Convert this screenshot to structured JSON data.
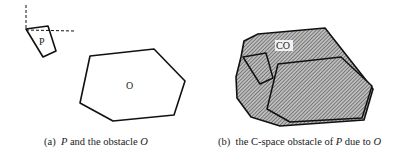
{
  "panels": [
    {
      "id": "a",
      "caption": {
        "prefix": "(a)  ",
        "var1": "P",
        "middle": " and the obstacle ",
        "var2": "O"
      },
      "shapes": {
        "robot_label": "P",
        "obstacle_label": "O"
      }
    },
    {
      "id": "b",
      "caption": {
        "prefix": "(b)  the C-space obstacle of ",
        "var1": "P",
        "middle": " due to ",
        "var2": "O"
      },
      "shapes": {
        "cspace_label": "CO"
      }
    }
  ],
  "colors": {
    "stroke": "#111111",
    "hatch_bg": "#b8b8b8",
    "hatch_line": "#4a4a4a",
    "background": "#ffffff"
  }
}
